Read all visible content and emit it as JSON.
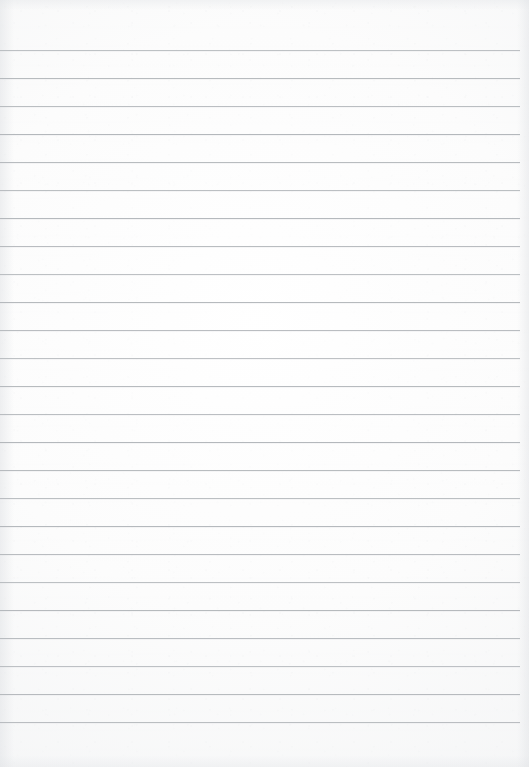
{
  "document": {
    "title": "Lined Notebook Page",
    "kind": "blank-ruled-paper-scan",
    "page_width": 529,
    "page_height": 767,
    "has_text_content": false,
    "written_content": ""
  },
  "paper": {
    "background_color": "#fcfcfc",
    "edge_shadow_color": "#e1e3e6",
    "texture": "fine-fiber-grain"
  },
  "ruling": {
    "line_color": "#b2b6ba",
    "line_thickness_px": 1,
    "line_count": 25,
    "first_line_y": 50,
    "line_spacing_px": 28,
    "line_left_x": 0,
    "line_right_x": 520,
    "top_margin_px": 50,
    "bottom_margin_px": 45,
    "right_margin_px": 9,
    "has_vertical_margin_rule": false,
    "lines": [
      {
        "index": 1,
        "y": 50,
        "content": ""
      },
      {
        "index": 2,
        "y": 78,
        "content": ""
      },
      {
        "index": 3,
        "y": 106,
        "content": ""
      },
      {
        "index": 4,
        "y": 134,
        "content": ""
      },
      {
        "index": 5,
        "y": 162,
        "content": ""
      },
      {
        "index": 6,
        "y": 190,
        "content": ""
      },
      {
        "index": 7,
        "y": 218,
        "content": ""
      },
      {
        "index": 8,
        "y": 246,
        "content": ""
      },
      {
        "index": 9,
        "y": 274,
        "content": ""
      },
      {
        "index": 10,
        "y": 302,
        "content": ""
      },
      {
        "index": 11,
        "y": 330,
        "content": ""
      },
      {
        "index": 12,
        "y": 358,
        "content": ""
      },
      {
        "index": 13,
        "y": 386,
        "content": ""
      },
      {
        "index": 14,
        "y": 414,
        "content": ""
      },
      {
        "index": 15,
        "y": 442,
        "content": ""
      },
      {
        "index": 16,
        "y": 470,
        "content": ""
      },
      {
        "index": 17,
        "y": 498,
        "content": ""
      },
      {
        "index": 18,
        "y": 526,
        "content": ""
      },
      {
        "index": 19,
        "y": 554,
        "content": ""
      },
      {
        "index": 20,
        "y": 582,
        "content": ""
      },
      {
        "index": 21,
        "y": 610,
        "content": ""
      },
      {
        "index": 22,
        "y": 638,
        "content": ""
      },
      {
        "index": 23,
        "y": 666,
        "content": ""
      },
      {
        "index": 24,
        "y": 694,
        "content": ""
      },
      {
        "index": 25,
        "y": 722,
        "content": ""
      }
    ]
  }
}
